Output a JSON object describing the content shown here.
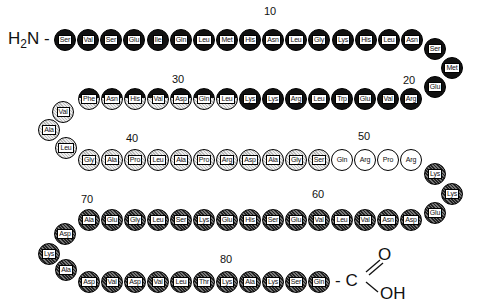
{
  "n_terminus": {
    "text": "H",
    "sub": "2",
    "rest": "N -"
  },
  "c_terminus": {
    "dash": "- C",
    "o": "O",
    "oh": "OH"
  },
  "numbers": [
    {
      "label": "10",
      "x": 264,
      "y": 5
    },
    {
      "label": "20",
      "x": 403,
      "y": 74
    },
    {
      "label": "30",
      "x": 172,
      "y": 73
    },
    {
      "label": "40",
      "x": 126,
      "y": 132
    },
    {
      "label": "50",
      "x": 358,
      "y": 130
    },
    {
      "label": "60",
      "x": 312,
      "y": 188
    },
    {
      "label": "70",
      "x": 81,
      "y": 193
    },
    {
      "label": "80",
      "x": 220,
      "y": 253
    }
  ],
  "legend_styles": {
    "black": "#111111",
    "dark_stipple": "#555555",
    "light_stipple": "#cccccc",
    "white": "#ffffff"
  },
  "residues": [
    {
      "n": 1,
      "aa": "Ser",
      "style": "black",
      "x": 65,
      "y": 40
    },
    {
      "n": 2,
      "aa": "Val",
      "style": "black",
      "x": 88,
      "y": 40
    },
    {
      "n": 3,
      "aa": "Ser",
      "style": "black",
      "x": 111,
      "y": 40
    },
    {
      "n": 4,
      "aa": "Glu",
      "style": "black",
      "x": 134,
      "y": 40
    },
    {
      "n": 5,
      "aa": "Ile",
      "style": "black",
      "x": 158,
      "y": 40
    },
    {
      "n": 6,
      "aa": "Gln",
      "style": "black",
      "x": 181,
      "y": 40
    },
    {
      "n": 7,
      "aa": "Leu",
      "style": "black",
      "x": 204,
      "y": 40
    },
    {
      "n": 8,
      "aa": "Met",
      "style": "black",
      "x": 227,
      "y": 40
    },
    {
      "n": 9,
      "aa": "His",
      "style": "black",
      "x": 250,
      "y": 40
    },
    {
      "n": 10,
      "aa": "Asn",
      "style": "black",
      "x": 273,
      "y": 40
    },
    {
      "n": 11,
      "aa": "Leu",
      "style": "black",
      "x": 296,
      "y": 40
    },
    {
      "n": 12,
      "aa": "Gly",
      "style": "black",
      "x": 319,
      "y": 40
    },
    {
      "n": 13,
      "aa": "Lys",
      "style": "black",
      "x": 343,
      "y": 40
    },
    {
      "n": 14,
      "aa": "His",
      "style": "black",
      "x": 366,
      "y": 40
    },
    {
      "n": 15,
      "aa": "Leu",
      "style": "black",
      "x": 389,
      "y": 40
    },
    {
      "n": 16,
      "aa": "Asn",
      "style": "black",
      "x": 412,
      "y": 40
    },
    {
      "n": 17,
      "aa": "Ser",
      "style": "black",
      "x": 435,
      "y": 49
    },
    {
      "n": 18,
      "aa": "Met",
      "style": "black",
      "x": 452,
      "y": 68
    },
    {
      "n": 19,
      "aa": "Glu",
      "style": "black",
      "x": 435,
      "y": 87
    },
    {
      "n": 20,
      "aa": "Arg",
      "style": "black",
      "x": 411,
      "y": 99
    },
    {
      "n": 21,
      "aa": "Val",
      "style": "black",
      "x": 388,
      "y": 99
    },
    {
      "n": 22,
      "aa": "Glu",
      "style": "black",
      "x": 365,
      "y": 99
    },
    {
      "n": 23,
      "aa": "Trp",
      "style": "black",
      "x": 342,
      "y": 99
    },
    {
      "n": 24,
      "aa": "Leu",
      "style": "black",
      "x": 319,
      "y": 99
    },
    {
      "n": 25,
      "aa": "Arg",
      "style": "black",
      "x": 296,
      "y": 99
    },
    {
      "n": 26,
      "aa": "Lys",
      "style": "black",
      "x": 273,
      "y": 99
    },
    {
      "n": 27,
      "aa": "Lys",
      "style": "black",
      "x": 250,
      "y": 99
    },
    {
      "n": 28,
      "aa": "Leu",
      "style": "half",
      "x": 227,
      "y": 99
    },
    {
      "n": 29,
      "aa": "Gln",
      "style": "half",
      "x": 204,
      "y": 99
    },
    {
      "n": 30,
      "aa": "Asp",
      "style": "half",
      "x": 181,
      "y": 99
    },
    {
      "n": 31,
      "aa": "Val",
      "style": "half",
      "x": 158,
      "y": 99
    },
    {
      "n": 32,
      "aa": "His",
      "style": "half",
      "x": 135,
      "y": 99
    },
    {
      "n": 33,
      "aa": "Asn",
      "style": "half",
      "x": 112,
      "y": 99
    },
    {
      "n": 34,
      "aa": "Phe",
      "style": "half",
      "x": 89,
      "y": 99
    },
    {
      "n": 35,
      "aa": "Val",
      "style": "light",
      "x": 63,
      "y": 112
    },
    {
      "n": 36,
      "aa": "Ala",
      "style": "light",
      "x": 49,
      "y": 130
    },
    {
      "n": 37,
      "aa": "Leu",
      "style": "light",
      "x": 66,
      "y": 148
    },
    {
      "n": 38,
      "aa": "Gly",
      "style": "light",
      "x": 89,
      "y": 160
    },
    {
      "n": 39,
      "aa": "Ala",
      "style": "light",
      "x": 112,
      "y": 160
    },
    {
      "n": 40,
      "aa": "Pro",
      "style": "light",
      "x": 135,
      "y": 160
    },
    {
      "n": 41,
      "aa": "Leu",
      "style": "light",
      "x": 158,
      "y": 160
    },
    {
      "n": 42,
      "aa": "Ala",
      "style": "light",
      "x": 181,
      "y": 160
    },
    {
      "n": 43,
      "aa": "Pro",
      "style": "light",
      "x": 204,
      "y": 160
    },
    {
      "n": 44,
      "aa": "Arg",
      "style": "light",
      "x": 227,
      "y": 160
    },
    {
      "n": 45,
      "aa": "Asp",
      "style": "light",
      "x": 250,
      "y": 160
    },
    {
      "n": 46,
      "aa": "Ala",
      "style": "light",
      "x": 273,
      "y": 160
    },
    {
      "n": 47,
      "aa": "Gly",
      "style": "light",
      "x": 296,
      "y": 160
    },
    {
      "n": 48,
      "aa": "Ser",
      "style": "light",
      "x": 319,
      "y": 160
    },
    {
      "n": 49,
      "aa": "Gln",
      "style": "white",
      "x": 342,
      "y": 160
    },
    {
      "n": 50,
      "aa": "Arg",
      "style": "white",
      "x": 365,
      "y": 160
    },
    {
      "n": 51,
      "aa": "Pro",
      "style": "white",
      "x": 388,
      "y": 160
    },
    {
      "n": 52,
      "aa": "Arg",
      "style": "white",
      "x": 411,
      "y": 160
    },
    {
      "n": 53,
      "aa": "Lys",
      "style": "dark",
      "x": 435,
      "y": 174
    },
    {
      "n": 54,
      "aa": "Lys",
      "style": "dark",
      "x": 452,
      "y": 194
    },
    {
      "n": 55,
      "aa": "Glu",
      "style": "dark",
      "x": 435,
      "y": 213
    },
    {
      "n": 56,
      "aa": "Asp",
      "style": "dark",
      "x": 411,
      "y": 220
    },
    {
      "n": 57,
      "aa": "Asn",
      "style": "dark",
      "x": 388,
      "y": 220
    },
    {
      "n": 58,
      "aa": "Val",
      "style": "dark",
      "x": 365,
      "y": 220
    },
    {
      "n": 59,
      "aa": "Leu",
      "style": "dark",
      "x": 342,
      "y": 220
    },
    {
      "n": 60,
      "aa": "Val",
      "style": "dark",
      "x": 319,
      "y": 220
    },
    {
      "n": 61,
      "aa": "Glu",
      "style": "dark",
      "x": 296,
      "y": 220
    },
    {
      "n": 62,
      "aa": "Ser",
      "style": "dark",
      "x": 273,
      "y": 220
    },
    {
      "n": 63,
      "aa": "His",
      "style": "dark",
      "x": 250,
      "y": 220
    },
    {
      "n": 64,
      "aa": "Glu",
      "style": "dark",
      "x": 227,
      "y": 220
    },
    {
      "n": 65,
      "aa": "Lys",
      "style": "dark",
      "x": 204,
      "y": 220
    },
    {
      "n": 66,
      "aa": "Ser",
      "style": "dark",
      "x": 181,
      "y": 220
    },
    {
      "n": 67,
      "aa": "Leu",
      "style": "dark",
      "x": 158,
      "y": 220
    },
    {
      "n": 68,
      "aa": "Gly",
      "style": "dark",
      "x": 135,
      "y": 220
    },
    {
      "n": 69,
      "aa": "Glu",
      "style": "dark",
      "x": 112,
      "y": 220
    },
    {
      "n": 70,
      "aa": "Ala",
      "style": "dark",
      "x": 89,
      "y": 220
    },
    {
      "n": 71,
      "aa": "Asp",
      "style": "dark",
      "x": 65,
      "y": 234
    },
    {
      "n": 72,
      "aa": "Lys",
      "style": "dark",
      "x": 49,
      "y": 254
    },
    {
      "n": 73,
      "aa": "Ala",
      "style": "dark",
      "x": 66,
      "y": 270
    },
    {
      "n": 74,
      "aa": "Asp",
      "style": "dark",
      "x": 89,
      "y": 282
    },
    {
      "n": 75,
      "aa": "Val",
      "style": "dark",
      "x": 112,
      "y": 282
    },
    {
      "n": 76,
      "aa": "Asp",
      "style": "dark",
      "x": 135,
      "y": 282
    },
    {
      "n": 77,
      "aa": "Val",
      "style": "dark",
      "x": 158,
      "y": 282
    },
    {
      "n": 78,
      "aa": "Leu",
      "style": "dark",
      "x": 181,
      "y": 282
    },
    {
      "n": 79,
      "aa": "Thr",
      "style": "dark",
      "x": 204,
      "y": 282
    },
    {
      "n": 80,
      "aa": "Lys",
      "style": "dark",
      "x": 227,
      "y": 282
    },
    {
      "n": 81,
      "aa": "Ala",
      "style": "dark",
      "x": 250,
      "y": 282
    },
    {
      "n": 82,
      "aa": "Lys",
      "style": "dark",
      "x": 273,
      "y": 282
    },
    {
      "n": 83,
      "aa": "Ser",
      "style": "dark",
      "x": 296,
      "y": 282
    },
    {
      "n": 84,
      "aa": "Gln",
      "style": "dark",
      "x": 319,
      "y": 282
    }
  ]
}
